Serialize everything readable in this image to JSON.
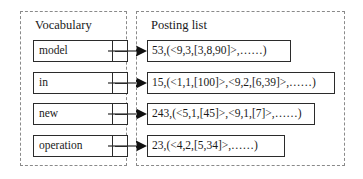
{
  "figure": {
    "type": "inverted-index-diagram",
    "colors": {
      "panel_border": "#8a8a8a",
      "box_border": "#2b2b2b",
      "text": "#1a1a1a",
      "background": "#ffffff"
    }
  },
  "vocabulary": {
    "title": "Vocabulary",
    "terms": [
      {
        "label": "model"
      },
      {
        "label": "in"
      },
      {
        "label": "new"
      },
      {
        "label": "operation"
      }
    ]
  },
  "posting": {
    "title": "Posting list",
    "entries": [
      {
        "text": "53,(<9,3,[3,8,90]>,……)"
      },
      {
        "text": "15,(<1,1,[100]>,<9,2,[6,39]>,……)"
      },
      {
        "text": "243,(<5,1,[45]>,<9,1,[7]>,……)"
      },
      {
        "text": "23,(<4,2,[5,34]>,……)"
      }
    ]
  },
  "connectors": [
    {
      "from": "model",
      "to": "53,(<9,3,[3,8,90]>,……)",
      "icon": "arrow-right-icon"
    },
    {
      "from": "in",
      "to": "15,(<1,1,[100]>,<9,2,[6,39]>,……)",
      "icon": "arrow-right-icon"
    },
    {
      "from": "new",
      "to": "243,(<5,1,[45]>,<9,1,[7]>,……)",
      "icon": "arrow-right-icon"
    },
    {
      "from": "operation",
      "to": "23,(<4,2,[5,34]>,……)",
      "icon": "arrow-right-icon"
    }
  ]
}
